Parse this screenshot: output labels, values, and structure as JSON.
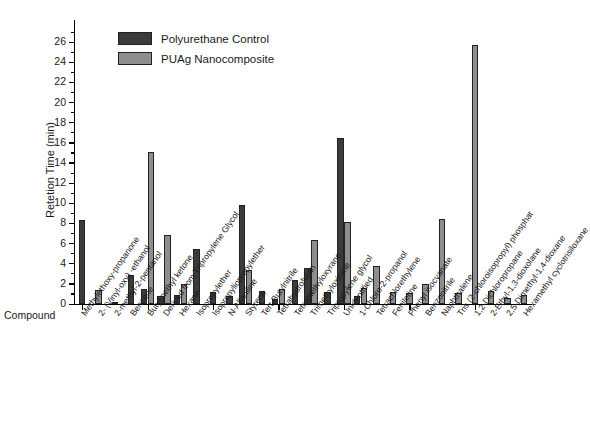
{
  "chart_data": {
    "type": "bar",
    "title": "",
    "xlabel": "Compound",
    "ylabel": "Retetion Time (min)",
    "ylim": [
      0,
      27
    ],
    "ytick_step": 2,
    "grid": false,
    "legend_position": "top-left",
    "yticks": [
      0,
      2,
      4,
      6,
      8,
      10,
      12,
      14,
      16,
      18,
      20,
      22,
      24,
      26
    ],
    "categories": [
      "Methylethoxy-propanone",
      "2- (Vinyl-oxy) -ethanol",
      "2-methyl-2-pentanol",
      "Benzene",
      "Butylmethyl ketone",
      "Derived from Tripropylene Glycol",
      "Hexane",
      "Isopropylether",
      "Isopropyliopropylether",
      "N-Allaniline",
      "Styrene",
      "Tert-Butylnitrile",
      "Tetrahydrofuran",
      "Tetramethyloxyrane",
      "Trimethyloxirane",
      "Tripropylene glycol",
      "Unidentified",
      "1-Chloro-2-propanol",
      "Tetrachlorethylene",
      "Feniletine",
      "Phenyl isocyanate",
      "Benzonitrile",
      "Naphthalene",
      "Tris (2-chloroisopropyl) phosphat",
      "1,2-Dichloropropane",
      "2-Ethyl-1,3-dioxolane",
      "2,5-Dimethyl-1,4-dioxane",
      "Hexamethyl cyclotrisiloxane"
    ],
    "series": [
      {
        "name": "Polyurethane Control",
        "color": "#3b3b3b",
        "values": [
          8.3,
          0,
          0.1,
          2.85,
          1.5,
          0.8,
          0.9,
          5.5,
          1.2,
          0.75,
          9.8,
          1.25,
          0.5,
          2.35,
          3.55,
          1.2,
          16.5,
          0.75,
          0,
          0,
          0,
          0,
          0,
          0,
          0,
          0,
          0,
          0
        ]
      },
      {
        "name": "PUAg Nanocomposite",
        "color": "#8e8e8e",
        "values": [
          0,
          1.35,
          0,
          0,
          15.1,
          6.9,
          1.95,
          0,
          0,
          0,
          3.35,
          0,
          1.5,
          0,
          6.35,
          0,
          8.1,
          1.6,
          3.75,
          1.2,
          1.1,
          2.0,
          8.4,
          1.1,
          25.7,
          1.3,
          0.55,
          0.9
        ]
      }
    ]
  },
  "legend": {
    "items": [
      {
        "label": "Polyurethane Control",
        "swatch": "dark"
      },
      {
        "label": "PUAg Nanocomposite",
        "swatch": "light"
      }
    ]
  },
  "axes": {
    "x_title": "Compound",
    "y_title": "Retetion Time (min)"
  }
}
